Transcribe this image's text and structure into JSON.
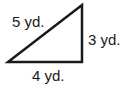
{
  "figure": {
    "shape": "right triangle",
    "sides": {
      "hypotenuse": "5 yd.",
      "vertical_leg": "3 yd.",
      "horizontal_leg": "4 yd."
    },
    "stroke_color": "#1a1a1a"
  }
}
